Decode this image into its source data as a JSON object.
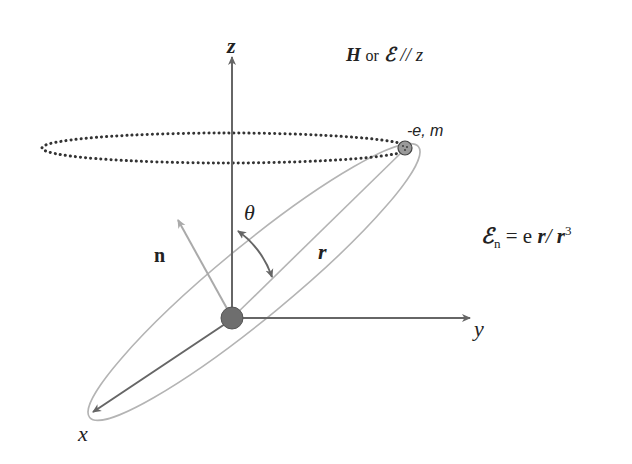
{
  "diagram": {
    "title_field": {
      "H": "H",
      "or": "or",
      "E": "ℰ",
      "parallel": "//",
      "z": "z"
    },
    "axes": {
      "z_label": "z",
      "y_label": "y",
      "x_label": "x"
    },
    "electron_label": "-e, m",
    "normal_label": "n",
    "angle_label": "θ",
    "radius_label": "r",
    "formula": {
      "E": "ℰ",
      "sub": "n",
      "eq": " = e ",
      "r": "r",
      "slash": "/ ",
      "r2": "r",
      "exp": "3"
    },
    "colors": {
      "axis": "#666666",
      "light_line": "#aaaaaa",
      "nucleus": "#6e6e6e",
      "electron": "#9a9a9a",
      "dotted_orbit": "#333333",
      "text": "#222222"
    }
  }
}
